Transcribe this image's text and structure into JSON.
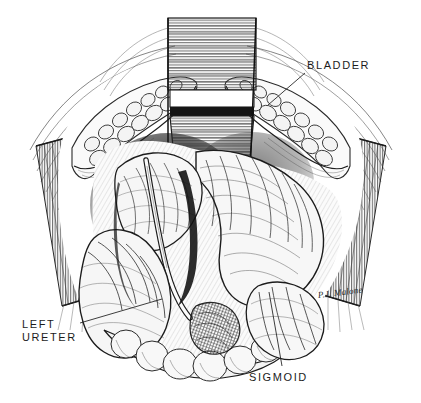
{
  "image": {
    "title": "Pelvic surgical exposure — pen and ink anatomical illustration",
    "medium": "pen-and-ink line engraving / cross-hatch",
    "background_color": "#ffffff",
    "ink_color": "#1c1c1c",
    "width": 421,
    "height": 403
  },
  "labels": [
    {
      "id": "bladder",
      "text": "BLADDER",
      "x": 307,
      "y": 59,
      "leader": {
        "x1": 305,
        "y1": 72,
        "x2": 268,
        "y2": 104
      }
    },
    {
      "id": "left_ureter",
      "text": "LEFT\nURETER",
      "line1": "LEFT",
      "line2": "URETER",
      "x": 22,
      "y": 318,
      "leader": {
        "x1": 80,
        "y1": 322,
        "x2": 160,
        "y2": 300
      }
    },
    {
      "id": "sigmoid",
      "text": "SIGMOID",
      "x": 249,
      "y": 371,
      "leader": {
        "x1": 281,
        "y1": 366,
        "x2": 269,
        "y2": 292
      }
    }
  ],
  "signature": {
    "text": "P.J. Malone",
    "x": 318,
    "y": 290
  },
  "structures": [
    {
      "name": "top-retractor-blade",
      "type": "instrument",
      "note": "vertical retractor blade, horizontal hatching, top center"
    },
    {
      "name": "left-retractor-blade",
      "type": "instrument",
      "note": "vertical hatching, left margin"
    },
    {
      "name": "right-retractor-blade",
      "type": "instrument",
      "note": "vertical hatching, right margin"
    },
    {
      "name": "left-fat-pad",
      "type": "adipose",
      "note": "cobblestone lobules, upper left"
    },
    {
      "name": "right-fat-pad",
      "type": "adipose",
      "note": "cobblestone lobules, upper right, bladder label target"
    },
    {
      "name": "bowel-loops",
      "type": "viscera",
      "note": "cross-hatched coiled colon filling the cavity"
    },
    {
      "name": "sigmoid-colon",
      "type": "viscera",
      "note": "lower right bowel loop"
    },
    {
      "name": "left-ureter",
      "type": "tube",
      "note": "slender tube crossing lower left bowel"
    },
    {
      "name": "cavity-shadow",
      "type": "shadow",
      "note": "dark stipple in deep pelvis, upper center-left"
    }
  ]
}
